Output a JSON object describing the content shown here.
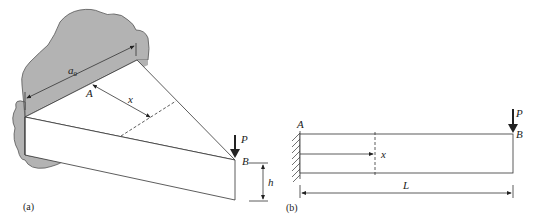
{
  "figure_a": {
    "caption": "(a)",
    "labels": {
      "width": "a",
      "width_sub": "0",
      "point_a": "A",
      "distance": "x",
      "load": "P",
      "point_b": "B",
      "height": "h"
    },
    "colors": {
      "wall": "#b3b3b3",
      "beam": "#ffffff",
      "line": "#333333"
    }
  },
  "figure_b": {
    "caption": "(b)",
    "labels": {
      "point_a": "A",
      "point_b": "B",
      "load": "P",
      "distance": "x",
      "length": "L"
    }
  }
}
